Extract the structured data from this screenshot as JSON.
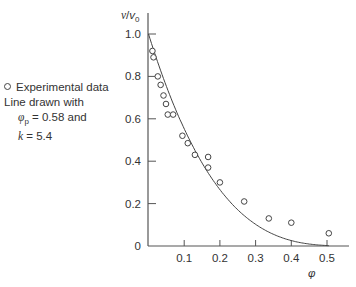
{
  "chart_data": {
    "type": "scatter",
    "title": "",
    "xlabel": "φ",
    "ylabel": "v/v0",
    "xlim": [
      0,
      0.55
    ],
    "ylim": [
      0,
      1.0
    ],
    "grid": false,
    "x_ticks": [
      0.1,
      0.2,
      0.3,
      0.4,
      0.5
    ],
    "x_tick_labels": [
      "0.1",
      "0.2",
      "0.3",
      "0.4",
      "0.5"
    ],
    "y_ticks": [
      0,
      0.2,
      0.4,
      0.6,
      0.8,
      1.0
    ],
    "y_tick_labels": [
      "0",
      "0.2",
      "0.4",
      "0.6",
      "0.8",
      "1.0"
    ],
    "series": [
      {
        "name": "Experimental data",
        "kind": "scatter",
        "marker": "open-circle",
        "x": [
          0.011,
          0.014,
          0.026,
          0.034,
          0.042,
          0.049,
          0.054,
          0.069,
          0.095,
          0.11,
          0.13,
          0.167,
          0.167,
          0.2,
          0.268,
          0.337,
          0.4,
          0.505
        ],
        "y": [
          0.92,
          0.89,
          0.8,
          0.76,
          0.71,
          0.67,
          0.62,
          0.62,
          0.52,
          0.485,
          0.43,
          0.42,
          0.37,
          0.3,
          0.21,
          0.13,
          0.11,
          0.06
        ]
      },
      {
        "name": "Fitted line",
        "kind": "line",
        "model": "v/v0 = (1 - φ/φp)^(k·φp)",
        "phi_p": 0.58,
        "k": 5.4,
        "x_range": [
          0,
          0.505
        ]
      }
    ],
    "legend": {
      "position": "left",
      "entries": [
        "Experimental data"
      ],
      "annotation": [
        "Line drawn with",
        "φp = 0.58 and",
        "k = 5.4"
      ]
    }
  },
  "legend": {
    "marker_label": "Experimental data",
    "line1": "Line drawn with",
    "phi_symbol": "φ",
    "phi_sub": "p",
    "phi_value": " = 0.58 and",
    "k_symbol": "k",
    "k_value": " = 5.4"
  },
  "axes": {
    "y_label_v": "v",
    "y_label_slash": "/",
    "y_label_v0": "v",
    "y_label_sub": "0",
    "x_label": "φ"
  }
}
